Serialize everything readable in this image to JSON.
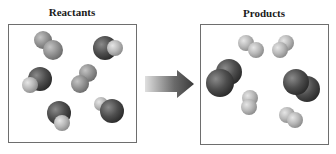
{
  "diagram": {
    "reactants": {
      "title": "Reactants",
      "molecules": [
        {
          "type": "homonuclear-light",
          "atoms": [
            {
              "cx": 43,
              "cy": 40,
              "r": 9
            },
            {
              "cx": 53,
              "cy": 50,
              "r": 10
            }
          ]
        },
        {
          "type": "heteronuclear",
          "atoms": [
            {
              "cx": 105,
              "cy": 48,
              "r": 12,
              "shade": "dark"
            },
            {
              "cx": 115,
              "cy": 48,
              "r": 8,
              "shade": "light"
            }
          ]
        },
        {
          "type": "heteronuclear",
          "atoms": [
            {
              "cx": 40,
              "cy": 79,
              "r": 12,
              "shade": "dark"
            },
            {
              "cx": 30,
              "cy": 85,
              "r": 8,
              "shade": "light"
            }
          ]
        },
        {
          "type": "homonuclear-light",
          "atoms": [
            {
              "cx": 88,
              "cy": 73,
              "r": 9
            },
            {
              "cx": 80,
              "cy": 84,
              "r": 9
            }
          ]
        },
        {
          "type": "heteronuclear",
          "atoms": [
            {
              "cx": 59,
              "cy": 113,
              "r": 12,
              "shade": "dark"
            },
            {
              "cx": 62,
              "cy": 123,
              "r": 8,
              "shade": "light"
            }
          ]
        },
        {
          "type": "heteronuclear",
          "atoms": [
            {
              "cx": 101,
              "cy": 104,
              "r": 7,
              "shade": "light"
            },
            {
              "cx": 112,
              "cy": 111,
              "r": 12,
              "shade": "dark"
            }
          ]
        }
      ]
    },
    "arrow": {
      "direction": "right",
      "label": ""
    },
    "products": {
      "title": "Products",
      "molecules": [
        {
          "type": "homonuclear-light",
          "atoms": [
            {
              "cx": 246,
              "cy": 43,
              "r": 8
            },
            {
              "cx": 256,
              "cy": 50,
              "r": 8
            }
          ]
        },
        {
          "type": "homonuclear-light",
          "atoms": [
            {
              "cx": 286,
              "cy": 43,
              "r": 8
            },
            {
              "cx": 280,
              "cy": 50,
              "r": 8
            }
          ]
        },
        {
          "type": "homonuclear-dark",
          "atoms": [
            {
              "cx": 229,
              "cy": 72,
              "r": 13
            },
            {
              "cx": 220,
              "cy": 83,
              "r": 14
            }
          ]
        },
        {
          "type": "homonuclear-dark",
          "atoms": [
            {
              "cx": 307,
              "cy": 89,
              "r": 13
            },
            {
              "cx": 296,
              "cy": 82,
              "r": 13
            }
          ]
        },
        {
          "type": "homonuclear-light",
          "atoms": [
            {
              "cx": 250,
              "cy": 98,
              "r": 8
            },
            {
              "cx": 249,
              "cy": 107,
              "r": 8
            }
          ]
        },
        {
          "type": "homonuclear-light",
          "atoms": [
            {
              "cx": 287,
              "cy": 115,
              "r": 8
            },
            {
              "cx": 295,
              "cy": 120,
              "r": 8
            }
          ]
        }
      ]
    },
    "colors": {
      "dark_atom": "#4a4a4a",
      "light_atom": "#b8b8b8",
      "medium_atom": "#8c8c8c",
      "border": "#6e6e6e",
      "arrow_dark": "#3a3a3a",
      "arrow_light": "#d8d8d8"
    }
  }
}
